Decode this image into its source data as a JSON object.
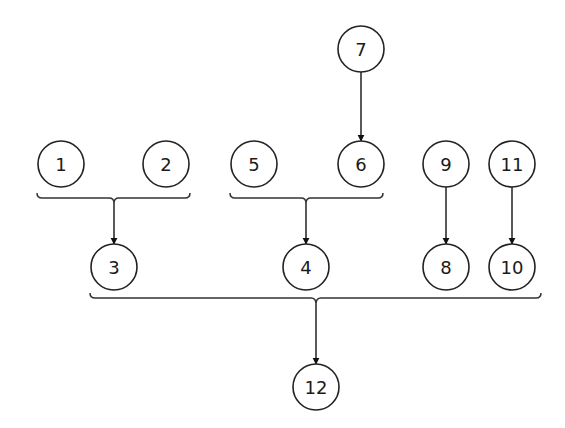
{
  "diagram": {
    "type": "dependency-tree",
    "nodes": [
      {
        "id": "1",
        "label": "1",
        "x": 61,
        "y": 164
      },
      {
        "id": "2",
        "label": "2",
        "x": 166,
        "y": 164
      },
      {
        "id": "3",
        "label": "3",
        "x": 114,
        "y": 267
      },
      {
        "id": "4",
        "label": "4",
        "x": 306,
        "y": 267
      },
      {
        "id": "5",
        "label": "5",
        "x": 254,
        "y": 164
      },
      {
        "id": "6",
        "label": "6",
        "x": 357,
        "y": 164
      },
      {
        "id": "7",
        "label": "7",
        "x": 361,
        "y": 49
      },
      {
        "id": "8",
        "label": "8",
        "x": 446,
        "y": 267
      },
      {
        "id": "9",
        "label": "9",
        "x": 446,
        "y": 164
      },
      {
        "id": "10",
        "label": "10",
        "x": 512,
        "y": 267
      },
      {
        "id": "11",
        "label": "11",
        "x": 512,
        "y": 164
      },
      {
        "id": "12",
        "label": "12",
        "x": 316,
        "y": 387
      }
    ],
    "edges": [
      {
        "from": "7",
        "to": "6"
      },
      {
        "from": "9",
        "to": "8"
      },
      {
        "from": "11",
        "to": "10"
      }
    ],
    "groups": [
      {
        "members": [
          "1",
          "2"
        ],
        "to": "3"
      },
      {
        "members": [
          "5",
          "6"
        ],
        "to": "4"
      },
      {
        "members": [
          "3",
          "4",
          "8",
          "10"
        ],
        "to": "12"
      }
    ],
    "colors": {
      "stroke": "#222222",
      "background": "#ffffff",
      "text": "#1a1a1a"
    }
  }
}
